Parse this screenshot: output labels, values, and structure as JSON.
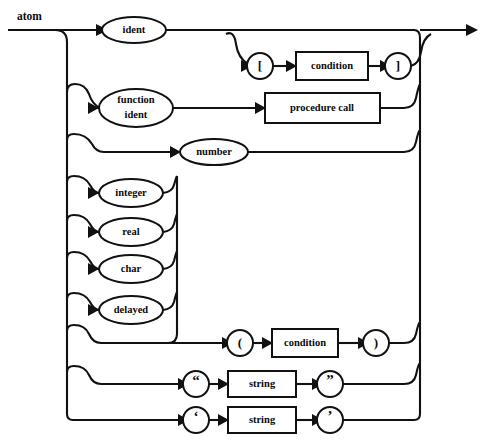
{
  "diagram": {
    "type": "railroad-syntax-diagram",
    "title": "atom",
    "title_position": {
      "x": 17,
      "y": 17
    },
    "canvas": {
      "width": 483,
      "height": 446
    },
    "colors": {
      "line": "#111111",
      "text": "#0b0b0b",
      "background": "#ffffff"
    },
    "entry": {
      "x": 8,
      "y": 30
    },
    "exit": {
      "x": 477,
      "y": 30
    },
    "left_rail_x": 67,
    "right_rail_x": 420,
    "type_merge_rail_x": 177,
    "nodes": [
      {
        "id": "ident",
        "shape": "ellipse",
        "label": "ident",
        "cx": 134,
        "cy": 30,
        "rx": 32,
        "ry": 13,
        "lines": 1
      },
      {
        "id": "bracket-open",
        "shape": "circle",
        "label": "[",
        "cx": 260,
        "cy": 66,
        "r": 13,
        "lines": 1
      },
      {
        "id": "condition-1",
        "shape": "rect",
        "label": "condition",
        "x": 296,
        "y": 52,
        "w": 72,
        "h": 28
      },
      {
        "id": "bracket-close",
        "shape": "circle",
        "label": "]",
        "cx": 398,
        "cy": 66,
        "r": 13,
        "lines": 1
      },
      {
        "id": "function-ident",
        "shape": "ellipse",
        "label": "function ident",
        "cx": 136,
        "cy": 108,
        "rx": 37,
        "ry": 19,
        "lines": 2,
        "line1": "function",
        "line2": "ident"
      },
      {
        "id": "procedure-call",
        "shape": "rect",
        "label": "procedure call",
        "x": 265,
        "y": 93,
        "w": 115,
        "h": 30
      },
      {
        "id": "number",
        "shape": "ellipse",
        "label": "number",
        "cx": 214,
        "cy": 152,
        "rx": 34,
        "ry": 13,
        "lines": 1
      },
      {
        "id": "integer",
        "shape": "ellipse",
        "label": "integer",
        "cx": 131,
        "cy": 193,
        "rx": 32,
        "ry": 14,
        "lines": 1
      },
      {
        "id": "real",
        "shape": "ellipse",
        "label": "real",
        "cx": 131,
        "cy": 232,
        "rx": 32,
        "ry": 14,
        "lines": 1
      },
      {
        "id": "char",
        "shape": "ellipse",
        "label": "char",
        "cx": 131,
        "cy": 269,
        "rx": 32,
        "ry": 14,
        "lines": 1
      },
      {
        "id": "delayed",
        "shape": "ellipse",
        "label": "delayed",
        "cx": 131,
        "cy": 310,
        "rx": 32,
        "ry": 14,
        "lines": 1
      },
      {
        "id": "paren-open",
        "shape": "circle",
        "label": "(",
        "cx": 240,
        "cy": 343,
        "r": 13,
        "lines": 1
      },
      {
        "id": "condition-2",
        "shape": "rect",
        "label": "condition",
        "x": 272,
        "y": 329,
        "w": 66,
        "h": 28
      },
      {
        "id": "paren-close",
        "shape": "circle",
        "label": ")",
        "cx": 376,
        "cy": 343,
        "r": 13,
        "lines": 1
      },
      {
        "id": "dquote-open",
        "shape": "circle",
        "label": "“",
        "cx": 196,
        "cy": 384,
        "r": 13,
        "lines": 1
      },
      {
        "id": "string-1",
        "shape": "rect",
        "label": "string",
        "x": 228,
        "y": 371,
        "w": 68,
        "h": 26
      },
      {
        "id": "dquote-close",
        "shape": "circle",
        "label": "”",
        "cx": 330,
        "cy": 384,
        "r": 13,
        "lines": 1
      },
      {
        "id": "squote-open",
        "shape": "circle",
        "label": "‘",
        "cx": 196,
        "cy": 420,
        "r": 13,
        "lines": 1
      },
      {
        "id": "string-2",
        "shape": "rect",
        "label": "string",
        "x": 228,
        "y": 407,
        "w": 68,
        "h": 26
      },
      {
        "id": "squote-close",
        "shape": "circle",
        "label": "’",
        "cx": 330,
        "cy": 420,
        "r": 13,
        "lines": 1
      }
    ],
    "branches": [
      {
        "id": "branch-ident",
        "label": "ident",
        "y": 30
      },
      {
        "id": "branch-index",
        "label": "[ condition ]",
        "y": 66
      },
      {
        "id": "branch-function-ident",
        "label": "function ident",
        "y": 108
      },
      {
        "id": "branch-number",
        "label": "number",
        "y": 152
      },
      {
        "id": "branch-integer",
        "label": "integer",
        "y": 193
      },
      {
        "id": "branch-real",
        "label": "real",
        "y": 232
      },
      {
        "id": "branch-char",
        "label": "char",
        "y": 269
      },
      {
        "id": "branch-delayed",
        "label": "delayed",
        "y": 310
      },
      {
        "id": "branch-paren",
        "label": "( condition )",
        "y": 343
      },
      {
        "id": "branch-dquote-string",
        "label": "“ string ”",
        "y": 384
      },
      {
        "id": "branch-squote-string",
        "label": "‘ string ’",
        "y": 420
      }
    ]
  }
}
